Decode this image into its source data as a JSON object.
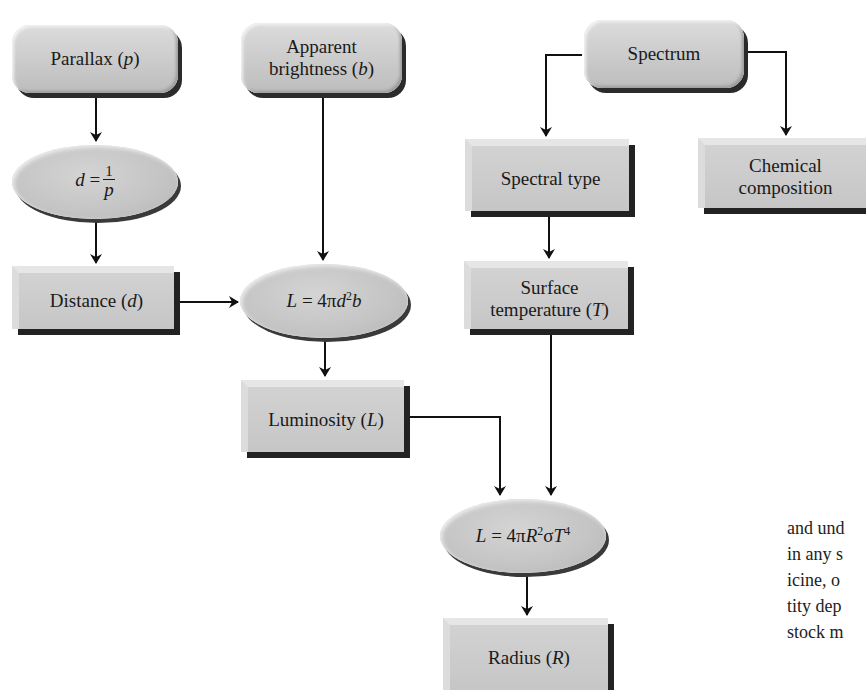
{
  "diagram": {
    "nodes": {
      "parallax": {
        "label": "Parallax",
        "var": "p"
      },
      "apparent_brightness": {
        "line1": "Apparent",
        "line2": "brightness",
        "var": "b"
      },
      "spectrum": {
        "label": "Spectrum"
      },
      "distance_formula": {
        "lhs": "d",
        "eq": "=",
        "num": "1",
        "den": "p"
      },
      "spectral_type": {
        "label": "Spectral type"
      },
      "chemical_composition": {
        "line1": "Chemical",
        "line2": "composition"
      },
      "distance": {
        "label": "Distance",
        "var": "d"
      },
      "luminosity_formula": {
        "lhs": "L",
        "rhs_a": " = 4π",
        "d": "d",
        "exp": "2",
        "b": "b"
      },
      "surface_temperature": {
        "line1": "Surface",
        "line2": "temperature",
        "var": "T"
      },
      "luminosity": {
        "label": "Luminosity",
        "var": "L"
      },
      "stefan_formula": {
        "lhs": "L",
        "rhs_a": " = 4π",
        "R": "R",
        "exp2": "2",
        "sigma": "σ",
        "T": "T",
        "exp4": "4"
      },
      "radius": {
        "label": "Radius",
        "var": "R"
      }
    },
    "edges": [
      [
        "Parallax (p)",
        "d = 1/p"
      ],
      [
        "d = 1/p",
        "Distance (d)"
      ],
      [
        "Distance (d)",
        "L = 4πd²b"
      ],
      [
        "Apparent brightness (b)",
        "L = 4πd²b"
      ],
      [
        "L = 4πd²b",
        "Luminosity (L)"
      ],
      [
        "Spectrum",
        "Spectral type"
      ],
      [
        "Spectrum",
        "Chemical composition"
      ],
      [
        "Spectral type",
        "Surface temperature (T)"
      ],
      [
        "Luminosity (L)",
        "L = 4πR²σT⁴"
      ],
      [
        "Surface temperature (T)",
        "L = 4πR²σT⁴"
      ],
      [
        "L = 4πR²σT⁴",
        "Radius (R)"
      ]
    ]
  },
  "body_text": {
    "lines": [
      "and und",
      "in any s",
      "icine, o",
      "tity dep",
      "stock m"
    ]
  }
}
